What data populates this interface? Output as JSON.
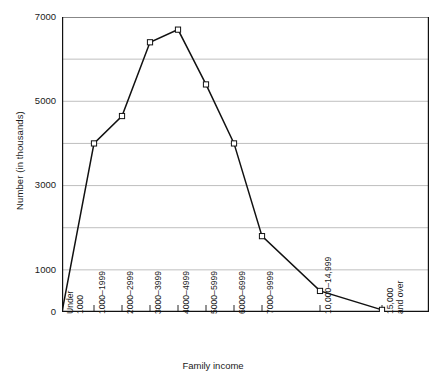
{
  "chart_data": {
    "type": "line",
    "title": "",
    "xlabel": "Family income",
    "ylabel": "Number (in thousands)",
    "categories": [
      "Under 1000",
      "1000–1999",
      "2000–2999",
      "3000–3999",
      "4000–4999",
      "5000–5999",
      "6000–6999",
      "7000–9999",
      "10,000–14,999",
      "15,000 and over"
    ],
    "values": [
      0,
      4000,
      4650,
      6400,
      6700,
      5400,
      4000,
      1800,
      500,
      50
    ],
    "ylim": [
      0,
      7000
    ],
    "y_ticks": [
      0,
      1000,
      2000,
      3000,
      4000,
      5000,
      6000,
      7000
    ],
    "y_tick_labels": [
      "0",
      "1000",
      "",
      "3000",
      "",
      "5000",
      "",
      "7000"
    ],
    "grid": true,
    "legend": null,
    "marker": "open-square",
    "line_color": "#111111",
    "grid_color": "#b8b8b8",
    "axis_color": "#111111"
  },
  "x_tick_labels": [
    {
      "line1": "Under",
      "line2": "1000"
    },
    {
      "line1": "1000–1999",
      "line2": ""
    },
    {
      "line1": "2000–2999",
      "line2": ""
    },
    {
      "line1": "3000–3999",
      "line2": ""
    },
    {
      "line1": "4000–4999",
      "line2": ""
    },
    {
      "line1": "5000–5999",
      "line2": ""
    },
    {
      "line1": "6000–6999",
      "line2": ""
    },
    {
      "line1": "7000–9999",
      "line2": ""
    },
    {
      "line1": "10,000–14,999",
      "line2": ""
    },
    {
      "line1": "15,000",
      "line2": "and over"
    }
  ],
  "y_axis": {
    "title": "Number (in thousands)",
    "labels": [
      "7000",
      "5000",
      "3000",
      "1000",
      "0"
    ]
  },
  "x_axis": {
    "title": "Family income"
  }
}
